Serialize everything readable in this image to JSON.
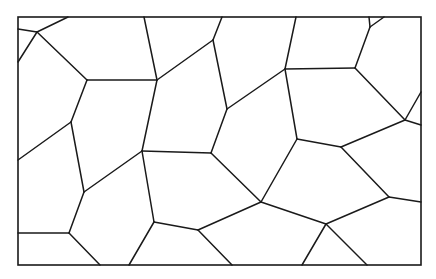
{
  "diagram": {
    "type": "voronoi-tessellation",
    "background": "#ffffff",
    "stroke_color": "#1a1a1a",
    "frame": {
      "x": 18,
      "y": 17,
      "width": 403,
      "height": 248
    },
    "edges": [
      [
        18,
        29,
        37,
        32
      ],
      [
        37,
        32,
        68,
        17
      ],
      [
        37,
        32,
        18,
        62
      ],
      [
        37,
        32,
        87,
        80
      ],
      [
        87,
        80,
        157,
        80
      ],
      [
        157,
        80,
        144,
        17
      ],
      [
        157,
        80,
        213,
        40
      ],
      [
        213,
        40,
        222,
        17
      ],
      [
        213,
        40,
        227,
        109
      ],
      [
        227,
        109,
        285,
        69
      ],
      [
        285,
        69,
        296,
        17
      ],
      [
        285,
        69,
        355,
        68
      ],
      [
        355,
        68,
        370,
        27
      ],
      [
        370,
        27,
        369,
        17
      ],
      [
        370,
        27,
        384,
        17
      ],
      [
        355,
        68,
        405,
        120
      ],
      [
        405,
        120,
        421,
        92
      ],
      [
        405,
        120,
        421,
        125
      ],
      [
        405,
        120,
        341,
        147
      ],
      [
        285,
        69,
        297,
        139
      ],
      [
        297,
        139,
        341,
        147
      ],
      [
        297,
        139,
        261,
        202
      ],
      [
        341,
        147,
        389,
        197
      ],
      [
        389,
        197,
        421,
        202
      ],
      [
        389,
        197,
        326,
        224
      ],
      [
        326,
        224,
        261,
        202
      ],
      [
        326,
        224,
        302,
        265
      ],
      [
        326,
        224,
        367,
        265
      ],
      [
        261,
        202,
        198,
        230
      ],
      [
        261,
        202,
        211,
        153
      ],
      [
        211,
        153,
        227,
        109
      ],
      [
        211,
        153,
        142,
        151
      ],
      [
        157,
        80,
        142,
        151
      ],
      [
        142,
        151,
        84,
        192
      ],
      [
        142,
        151,
        154,
        222
      ],
      [
        154,
        222,
        198,
        230
      ],
      [
        198,
        230,
        232,
        265
      ],
      [
        154,
        222,
        129,
        265
      ],
      [
        87,
        80,
        71,
        122
      ],
      [
        71,
        122,
        18,
        160
      ],
      [
        71,
        122,
        84,
        192
      ],
      [
        84,
        192,
        69,
        233
      ],
      [
        69,
        233,
        18,
        233
      ],
      [
        69,
        233,
        100,
        265
      ]
    ]
  }
}
